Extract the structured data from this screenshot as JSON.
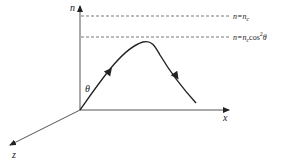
{
  "diagram": {
    "axes": {
      "vertical": {
        "label": "n"
      },
      "horizontal": {
        "label": "x"
      },
      "depth": {
        "label": "z"
      }
    },
    "reference_lines": [
      {
        "id": "critical",
        "label_main": "n=n",
        "label_sub": "c",
        "label_suffix": ""
      },
      {
        "id": "turning",
        "label_main": "n=n",
        "label_sub": "c",
        "label_suffix": "cos",
        "label_sup": "2",
        "label_tail": "θ"
      }
    ],
    "angle_label": "θ",
    "trajectory": {
      "direction_arrows": 2
    }
  }
}
